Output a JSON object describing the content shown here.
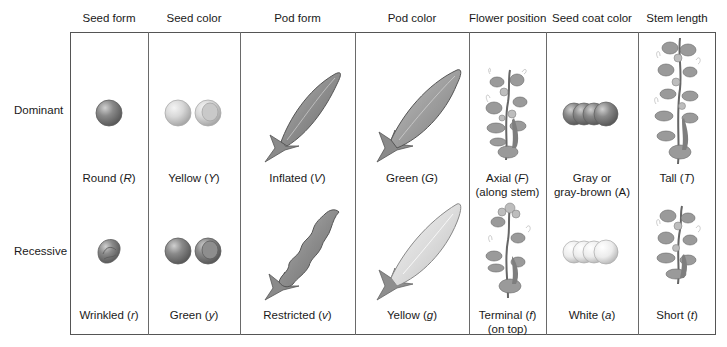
{
  "columns": [
    {
      "key": "seed_form",
      "header": "Seed form"
    },
    {
      "key": "seed_color",
      "header": "Seed color"
    },
    {
      "key": "pod_form",
      "header": "Pod form"
    },
    {
      "key": "pod_color",
      "header": "Pod color"
    },
    {
      "key": "flower_position",
      "header": "Flower position"
    },
    {
      "key": "seed_coat_color",
      "header": "Seed coat color"
    },
    {
      "key": "stem_length",
      "header": "Stem length"
    }
  ],
  "rows": {
    "dominant": {
      "label": "Dominant",
      "cells": [
        {
          "text": "Round (",
          "allele": "R",
          "close": ")",
          "line2": "",
          "image": "round-seed"
        },
        {
          "text": "Yellow (",
          "allele": "Y",
          "close": ")",
          "line2": "",
          "image": "yellow-seeds"
        },
        {
          "text": "Inflated (",
          "allele": "V",
          "close": ")",
          "line2": "",
          "image": "inflated-pod"
        },
        {
          "text": "Green (",
          "allele": "G",
          "close": ")",
          "line2": "",
          "image": "green-pod"
        },
        {
          "text": "Axial (",
          "allele": "F",
          "close": ")",
          "line2": "(along stem)",
          "image": "axial-flower-plant"
        },
        {
          "text": "Gray or",
          "allele": "",
          "close": "",
          "line2": "gray-brown (A)",
          "image": "gray-seed-coat"
        },
        {
          "text": "Tall (",
          "allele": "T",
          "close": ")",
          "line2": "",
          "image": "tall-plant"
        }
      ]
    },
    "recessive": {
      "label": "Recessive",
      "cells": [
        {
          "text": "Wrinkled (",
          "allele": "r",
          "close": ")",
          "line2": "",
          "image": "wrinkled-seed"
        },
        {
          "text": "Green (",
          "allele": "y",
          "close": ")",
          "line2": "",
          "image": "green-seeds"
        },
        {
          "text": "Restricted (",
          "allele": "v",
          "close": ")",
          "line2": "",
          "image": "restricted-pod"
        },
        {
          "text": "Yellow (",
          "allele": "g",
          "close": ")",
          "line2": "",
          "image": "yellow-pod"
        },
        {
          "text": "Terminal (",
          "allele": "f",
          "close": ")",
          "line2": "(on top)",
          "image": "terminal-flower-plant"
        },
        {
          "text": "White (",
          "allele": "a",
          "close": ")",
          "line2": "",
          "image": "white-seed-coat"
        },
        {
          "text": "Short (",
          "allele": "t",
          "close": ")",
          "line2": "",
          "image": "short-plant"
        }
      ]
    }
  },
  "colors": {
    "border": "#555555",
    "dark_gray": "#7a7a7a",
    "mid_gray": "#9a9a9a",
    "light_gray": "#d6d6d6"
  }
}
